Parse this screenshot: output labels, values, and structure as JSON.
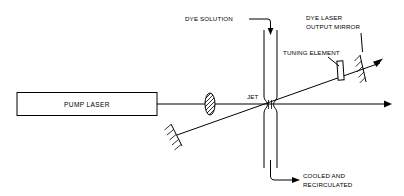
{
  "figure": {
    "background_color": "#ffffff",
    "line_color": "#000000",
    "width": 404,
    "height": 196
  },
  "labels": {
    "dye_solution": "DYE SOLUTION",
    "dye_laser_output_mirror_line1": "DYE LASER",
    "dye_laser_output_mirror_line2": "OUTPUT MIRROR",
    "tuning_element": "TUNING ELEMENT",
    "pump_laser": "PUMP LASER",
    "jet": "JET",
    "cooled_line1": "COOLED AND",
    "cooled_line2": "RECIRCULATED"
  },
  "components": [
    {
      "name": "pump-laser-box",
      "label": "PUMP LASER"
    },
    {
      "name": "focusing-lens",
      "label": ""
    },
    {
      "name": "dye-jet-nozzle",
      "label": "JET"
    },
    {
      "name": "tuning-element",
      "label": "TUNING ELEMENT"
    },
    {
      "name": "output-mirror",
      "label": "DYE LASER OUTPUT MIRROR"
    },
    {
      "name": "end-mirror",
      "label": ""
    }
  ],
  "beams": [
    {
      "name": "pump-beam",
      "direction": "horizontal-right"
    },
    {
      "name": "dye-laser-beam",
      "direction": "diagonal-up-right"
    }
  ],
  "flows": [
    {
      "name": "dye-inlet",
      "label": "DYE SOLUTION",
      "direction": "down"
    },
    {
      "name": "dye-outlet",
      "label": "COOLED AND RECIRCULATED",
      "direction": "right"
    }
  ]
}
